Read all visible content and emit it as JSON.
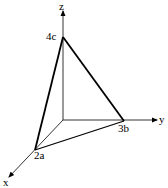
{
  "diagram": {
    "title": "",
    "type": "3d-coordinate-tetrahedron",
    "axes": {
      "x_label": "x",
      "y_label": "y",
      "z_label": "z"
    },
    "points": {
      "a": {
        "label": "2a",
        "axis": "x",
        "value": "2a"
      },
      "b": {
        "label": "3b",
        "axis": "y",
        "value": "3b"
      },
      "c": {
        "label": "4c",
        "axis": "z",
        "value": "4c"
      }
    },
    "colors": {
      "line": "#000000",
      "background": "#ffffff"
    }
  }
}
